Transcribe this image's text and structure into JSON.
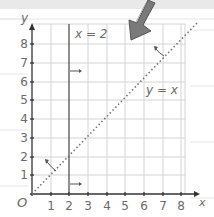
{
  "diagram": {
    "type": "coordinate-grid",
    "x_axis": {
      "label": "x",
      "ticks": [
        "1",
        "2",
        "3",
        "4",
        "5",
        "6",
        "7",
        "8"
      ]
    },
    "y_axis": {
      "label": "y",
      "ticks": [
        "1",
        "2",
        "3",
        "4",
        "5",
        "6",
        "7",
        "8"
      ]
    },
    "origin_label": "O",
    "lines": [
      {
        "name": "vertical-line",
        "equation": "x = 2",
        "style": "solid"
      },
      {
        "name": "diagonal-line",
        "equation": "y = x",
        "style": "dotted"
      }
    ],
    "pointer": "large gray arrow pointing down-left toward the grid top",
    "colors": {
      "grid": "#d4d4d4",
      "axis": "#333333",
      "line": "#555555",
      "text": "#6a6a6a",
      "arrow": "#7a7a7a",
      "ruling": "#e6e6e6"
    }
  }
}
